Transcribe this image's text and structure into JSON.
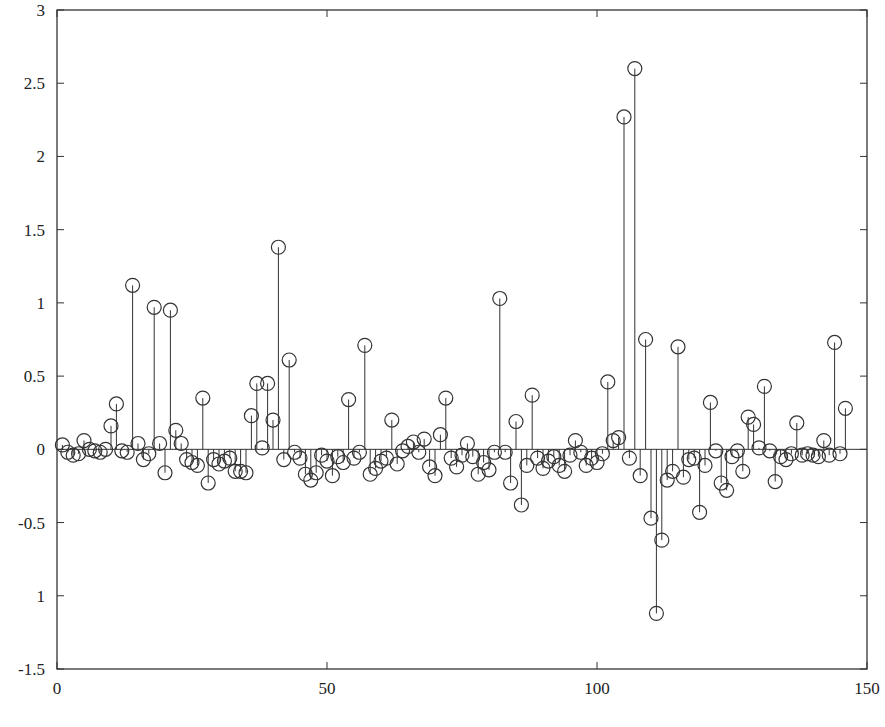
{
  "chart_data": {
    "type": "stem",
    "title": "",
    "xlabel": "",
    "ylabel": "",
    "xlim": [
      0,
      150
    ],
    "ylim": [
      -1.5,
      3
    ],
    "grid": false,
    "legend": null,
    "marker": "open-circle",
    "x_ticks": [
      0,
      50,
      100,
      150
    ],
    "x_tick_labels": [
      "0",
      "50",
      "100",
      "150"
    ],
    "y_ticks": [
      3,
      2.5,
      2,
      1.5,
      1,
      0.5,
      0,
      -0.5,
      -1,
      -1.5
    ],
    "y_tick_labels": [
      "3",
      "2.5",
      "2",
      "1.5",
      "1",
      "0.5",
      "0",
      "-0.5",
      "1",
      "-1.5"
    ],
    "series": [
      {
        "name": "signal",
        "x": [
          1,
          2,
          3,
          4,
          5,
          6,
          7,
          8,
          9,
          10,
          11,
          12,
          13,
          14,
          15,
          16,
          17,
          18,
          19,
          20,
          21,
          22,
          23,
          24,
          25,
          26,
          27,
          28,
          29,
          30,
          31,
          32,
          33,
          34,
          35,
          36,
          37,
          38,
          39,
          40,
          41,
          42,
          43,
          44,
          45,
          46,
          47,
          48,
          49,
          50,
          51,
          52,
          53,
          54,
          55,
          56,
          57,
          58,
          59,
          60,
          61,
          62,
          63,
          64,
          65,
          66,
          67,
          68,
          69,
          70,
          71,
          72,
          73,
          74,
          75,
          76,
          77,
          78,
          79,
          80,
          81,
          82,
          83,
          84,
          85,
          86,
          87,
          88,
          89,
          90,
          91,
          92,
          93,
          94,
          95,
          96,
          97,
          98,
          99,
          100,
          101,
          102,
          103,
          104,
          105,
          106,
          107,
          108,
          109,
          110,
          111,
          112,
          113,
          114,
          115,
          116,
          117,
          118,
          119,
          120,
          121,
          122,
          123,
          124,
          125,
          126,
          127,
          128,
          129,
          130,
          131,
          132,
          133,
          134,
          135,
          136,
          137,
          138,
          139,
          140,
          141,
          142,
          143,
          144,
          145,
          146
        ],
        "values": [
          0.03,
          -0.02,
          -0.04,
          -0.03,
          0.06,
          0.0,
          -0.01,
          -0.02,
          0.0,
          0.16,
          0.31,
          -0.01,
          -0.02,
          1.12,
          0.04,
          -0.07,
          -0.03,
          0.97,
          0.04,
          -0.16,
          0.95,
          0.13,
          0.04,
          -0.07,
          -0.09,
          -0.11,
          0.35,
          -0.23,
          -0.07,
          -0.1,
          -0.08,
          -0.06,
          -0.15,
          -0.15,
          -0.16,
          0.23,
          0.45,
          0.01,
          0.45,
          0.2,
          1.38,
          -0.07,
          0.61,
          -0.02,
          -0.06,
          -0.17,
          -0.21,
          -0.16,
          -0.04,
          -0.08,
          -0.18,
          -0.05,
          -0.09,
          0.34,
          -0.06,
          -0.02,
          0.71,
          -0.17,
          -0.13,
          -0.08,
          -0.06,
          0.2,
          -0.1,
          -0.01,
          0.02,
          0.05,
          -0.02,
          0.07,
          -0.12,
          -0.18,
          0.1,
          0.35,
          -0.06,
          -0.12,
          -0.04,
          0.04,
          -0.05,
          -0.17,
          -0.09,
          -0.14,
          -0.02,
          1.03,
          -0.02,
          -0.23,
          0.19,
          -0.38,
          -0.11,
          0.37,
          -0.06,
          -0.13,
          -0.08,
          -0.05,
          -0.11,
          -0.15,
          -0.04,
          0.06,
          -0.02,
          -0.11,
          -0.06,
          -0.09,
          -0.03,
          0.46,
          0.06,
          0.08,
          2.27,
          -0.06,
          2.6,
          -0.18,
          0.75,
          -0.47,
          -1.12,
          -0.62,
          -0.21,
          -0.15,
          0.7,
          -0.19,
          -0.07,
          -0.06,
          -0.43,
          -0.11,
          0.32,
          -0.01,
          -0.23,
          -0.28,
          -0.05,
          -0.01,
          -0.15,
          0.22,
          0.17,
          0.01,
          0.43,
          -0.01,
          -0.22,
          -0.05,
          -0.07,
          -0.03,
          0.18,
          -0.04,
          -0.03,
          -0.04,
          -0.05,
          0.06,
          -0.04,
          0.73,
          -0.03,
          0.28
        ]
      }
    ]
  },
  "axes": {
    "x_tick_labels": [
      "0",
      "50",
      "100",
      "150"
    ],
    "y_tick_labels": [
      "3",
      "2.5",
      "2",
      "1.5",
      "1",
      "0.5",
      "0",
      "-0.5",
      "1",
      "-1.5"
    ]
  },
  "colors": {
    "line": "#333333",
    "marker": "#333333",
    "axis": "#333333",
    "background": "#ffffff"
  }
}
